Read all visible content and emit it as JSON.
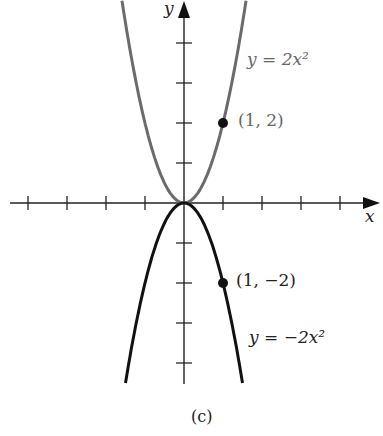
{
  "chart_data": {
    "type": "line",
    "title": "",
    "caption": "(c)",
    "xlabel": "x",
    "ylabel": "y",
    "xlim": [
      -4.6,
      5
    ],
    "ylim": [
      -4.5,
      5
    ],
    "grid": false,
    "x_ticks": [
      -4,
      -3,
      -2,
      -1,
      1,
      2,
      3,
      4
    ],
    "y_ticks": [
      -4,
      -3,
      -2,
      -1,
      1,
      2,
      3,
      4
    ],
    "series": [
      {
        "name": "y = 2x²",
        "formula": "2x^2",
        "color": "#6b6b6b",
        "x_range": [
          -1.59,
          1.59
        ]
      },
      {
        "name": "y = −2x²",
        "formula": "-2x^2",
        "color": "#111111",
        "x_range": [
          -1.5,
          1.5
        ]
      }
    ],
    "points": [
      {
        "x": 1,
        "y": 2,
        "label": "(1, 2)"
      },
      {
        "x": 1,
        "y": -2,
        "label": "(1, −2)"
      }
    ]
  },
  "labels": {
    "x_axis": "x",
    "y_axis": "y",
    "upper_curve_eq": "y  =  2x²",
    "lower_curve_eq": "y  =  −2x²",
    "upper_point": "(1, 2)",
    "lower_point": "(1, −2)",
    "caption": "(c)"
  }
}
